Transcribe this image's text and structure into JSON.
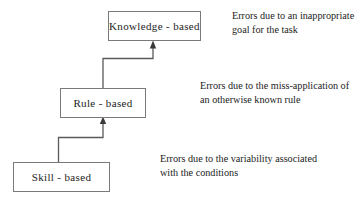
{
  "diagram": {
    "title_text": "",
    "nodes": [
      {
        "id": "knowledge",
        "label": "Knowledge - based"
      },
      {
        "id": "rule",
        "label": "Rule - based"
      },
      {
        "id": "skill",
        "label": "Skill - based"
      }
    ],
    "annotations": [
      {
        "id": "knowledge",
        "text": "Errors due to an inappropriate goal for the task"
      },
      {
        "id": "rule",
        "text": "Errors due to the miss-application of an otherwise known rule"
      },
      {
        "id": "skill",
        "text": "Errors due to the variability associated with the conditions"
      }
    ],
    "colors": {
      "box_border": "#7a7a7a",
      "connector": "#5a5a5a",
      "text": "#1c1c1c",
      "background": "#ffffff"
    }
  }
}
